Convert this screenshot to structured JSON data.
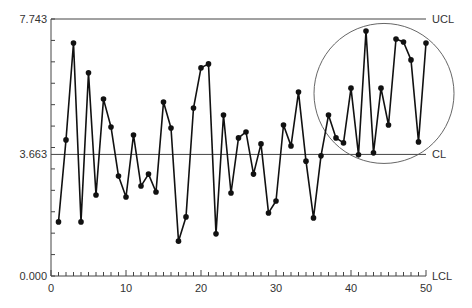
{
  "chart_data": {
    "type": "line",
    "title": "",
    "xlabel": "",
    "ylabel": "",
    "xlim": [
      0,
      50
    ],
    "ylim": [
      0.0,
      7.743
    ],
    "x_ticks": [
      0,
      10,
      20,
      30,
      40,
      50
    ],
    "x_tick_labels": [
      "0",
      "10",
      "20",
      "30",
      "40",
      "50"
    ],
    "y_tick_labels": [
      "0.000",
      "3.663",
      "7.743"
    ],
    "grid": false,
    "control_limits": [
      {
        "name": "UCL",
        "value": 7.743
      },
      {
        "name": "CL",
        "value": 3.663
      },
      {
        "name": "LCL",
        "value": 0.0
      }
    ],
    "annotation": {
      "type": "circle",
      "description": "highlights points ~36-50 trending above CL",
      "center_x": 44.4,
      "center_y": 5.5
    },
    "series": [
      {
        "name": "samples",
        "x": [
          1,
          2,
          3,
          4,
          5,
          6,
          7,
          8,
          9,
          10,
          11,
          12,
          13,
          14,
          15,
          16,
          17,
          18,
          19,
          20,
          21,
          22,
          23,
          24,
          25,
          26,
          27,
          28,
          29,
          30,
          31,
          32,
          33,
          34,
          35,
          36,
          37,
          38,
          39,
          40,
          41,
          42,
          43,
          44,
          45,
          46,
          47,
          48,
          49,
          50
        ],
        "values": [
          1.63,
          4.1,
          7.02,
          1.63,
          6.12,
          2.44,
          5.33,
          4.49,
          3.01,
          2.38,
          4.25,
          2.71,
          3.07,
          2.53,
          5.24,
          4.46,
          1.05,
          1.78,
          5.06,
          6.27,
          6.39,
          1.27,
          4.85,
          2.5,
          4.16,
          4.34,
          3.07,
          3.98,
          1.9,
          2.26,
          4.55,
          3.92,
          5.54,
          3.46,
          1.75,
          3.62,
          4.85,
          4.16,
          4.01,
          5.66,
          3.65,
          7.38,
          3.71,
          5.66,
          4.55,
          7.14,
          7.05,
          6.51,
          4.04,
          7.02
        ]
      }
    ],
    "colors": {
      "line": "#111111",
      "marker": "#111111",
      "limit_line": "#444444",
      "axis": "#444444",
      "text": "#333333"
    }
  }
}
